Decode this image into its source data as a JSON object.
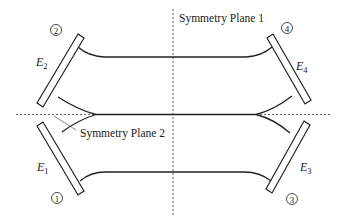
{
  "diagram": {
    "symmetry_planes": [
      {
        "id": 1,
        "label": "Symmetry Plane 1",
        "orientation": "vertical"
      },
      {
        "id": 2,
        "label": "Symmetry Plane 2",
        "orientation": "horizontal"
      }
    ],
    "electrodes": [
      {
        "id": 1,
        "label": "E",
        "subscript": "1",
        "port": "1"
      },
      {
        "id": 2,
        "label": "E",
        "subscript": "2",
        "port": "2"
      },
      {
        "id": 3,
        "label": "E",
        "subscript": "3",
        "port": "3"
      },
      {
        "id": 4,
        "label": "E",
        "subscript": "4",
        "port": "4"
      }
    ],
    "colors": {
      "line": "#222222",
      "dashed": "#555555",
      "background": "#ffffff"
    }
  }
}
